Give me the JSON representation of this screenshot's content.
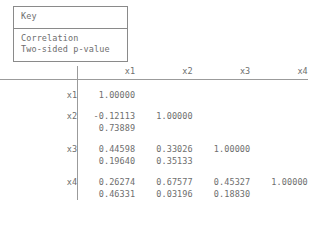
{
  "key": {
    "title": "Key",
    "lines": [
      "Correlation",
      "Two-sided p-value"
    ]
  },
  "matrix": {
    "column_headers": [
      "x1",
      "x2",
      "x3",
      "x4"
    ],
    "row_labels": [
      "x1",
      "x2",
      "x3",
      "x4"
    ],
    "rows": [
      {
        "label": "x1",
        "correlations": [
          "1.00000",
          "",
          "",
          ""
        ],
        "pvalues": [
          "",
          "",
          "",
          ""
        ]
      },
      {
        "label": "x2",
        "correlations": [
          "-0.12113",
          "1.00000",
          "",
          ""
        ],
        "pvalues": [
          "0.73889",
          "",
          "",
          ""
        ]
      },
      {
        "label": "x3",
        "correlations": [
          "0.44598",
          "0.33026",
          "1.00000",
          ""
        ],
        "pvalues": [
          "0.19640",
          "0.35133",
          "",
          ""
        ]
      },
      {
        "label": "x4",
        "correlations": [
          "0.26274",
          "0.67577",
          "0.45327",
          "1.00000"
        ],
        "pvalues": [
          "0.46331",
          "0.03196",
          "0.18830",
          ""
        ]
      }
    ]
  },
  "chart_data": {
    "type": "table",
    "categories": [
      "x1",
      "x2",
      "x3",
      "x4"
    ],
    "series": [
      {
        "name": "x1",
        "values": [
          1.0,
          null,
          null,
          null
        ]
      },
      {
        "name": "x2",
        "values": [
          -0.12113,
          1.0,
          null,
          null
        ]
      },
      {
        "name": "x3",
        "values": [
          0.44598,
          0.33026,
          1.0,
          null
        ]
      },
      {
        "name": "x4",
        "values": [
          0.26274,
          0.67577,
          0.45327,
          1.0
        ]
      }
    ],
    "pvalues": [
      {
        "name": "x1",
        "values": [
          null,
          null,
          null,
          null
        ]
      },
      {
        "name": "x2",
        "values": [
          0.73889,
          null,
          null,
          null
        ]
      },
      {
        "name": "x3",
        "values": [
          0.1964,
          0.35133,
          null,
          null
        ]
      },
      {
        "name": "x4",
        "values": [
          0.46331,
          0.03196,
          0.1883,
          null
        ]
      }
    ],
    "xlabel": "",
    "ylabel": "",
    "grid": false
  },
  "colors": {
    "text": "#6e6e6e",
    "rule": "#9b9b9b",
    "box_border": "#8a8a8a",
    "background": "#ffffff"
  }
}
